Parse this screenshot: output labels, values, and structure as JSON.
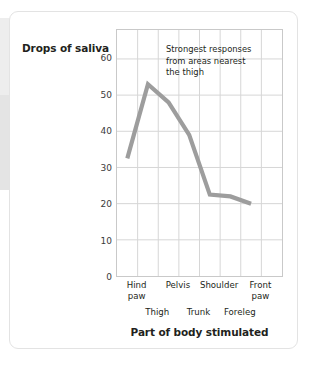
{
  "chart_data": {
    "type": "line",
    "title": "",
    "xlabel": "Part of body stimulated",
    "ylabel": "Drops of saliva",
    "ylim": [
      0,
      68
    ],
    "yticks": [
      0,
      10,
      20,
      30,
      40,
      50,
      60
    ],
    "ytick_labels": [
      "0",
      "10",
      "20",
      "30",
      "40",
      "50",
      "60"
    ],
    "grid": true,
    "legend": "none",
    "categories": [
      "Hind paw",
      "Thigh",
      "Pelvis",
      "Trunk",
      "Shoulder",
      "Foreleg",
      "Front paw"
    ],
    "categories_upper": [
      "Hind paw",
      "Pelvis",
      "Shoulder",
      "Front paw"
    ],
    "categories_lower": [
      "Thigh",
      "Trunk",
      "Foreleg"
    ],
    "values": [
      32.5,
      53,
      48,
      39,
      22.5,
      22,
      20
    ],
    "line_color": "#9d9d9d",
    "grid_color": "#d6d6d6",
    "frame_color": "#c9c9c9",
    "annotations": [
      {
        "text_line1": "Strongest responses",
        "text_line2": "from areas nearest",
        "text_line3": "the thigh"
      }
    ]
  },
  "axes": {
    "y_title": "Drops of saliva",
    "x_title": "Part of body stimulated",
    "y_tick_0": "0",
    "y_tick_1": "10",
    "y_tick_2": "20",
    "y_tick_3": "30",
    "y_tick_4": "40",
    "y_tick_5": "50",
    "y_tick_6": "60"
  },
  "x_labels": {
    "hind_paw_line1": "Hind",
    "hind_paw_line2": "paw",
    "pelvis": "Pelvis",
    "shoulder": "Shoulder",
    "front_paw_line1": "Front",
    "front_paw_line2": "paw",
    "thigh": "Thigh",
    "trunk": "Trunk",
    "foreleg": "Foreleg"
  },
  "annotation": {
    "line1": "Strongest responses",
    "line2": "from areas nearest",
    "line3": "the thigh"
  }
}
